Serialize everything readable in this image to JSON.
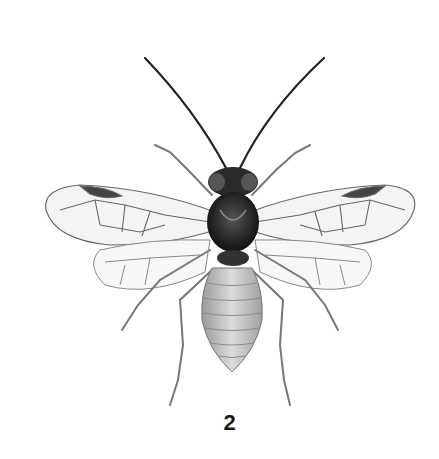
{
  "plate": {
    "figure_number": "2",
    "subject": "sawfly (Hymenoptera: Symphyta), dorsal view, wings spread",
    "background_color": "#ffffff",
    "ink_color": "#1a1a1a"
  }
}
